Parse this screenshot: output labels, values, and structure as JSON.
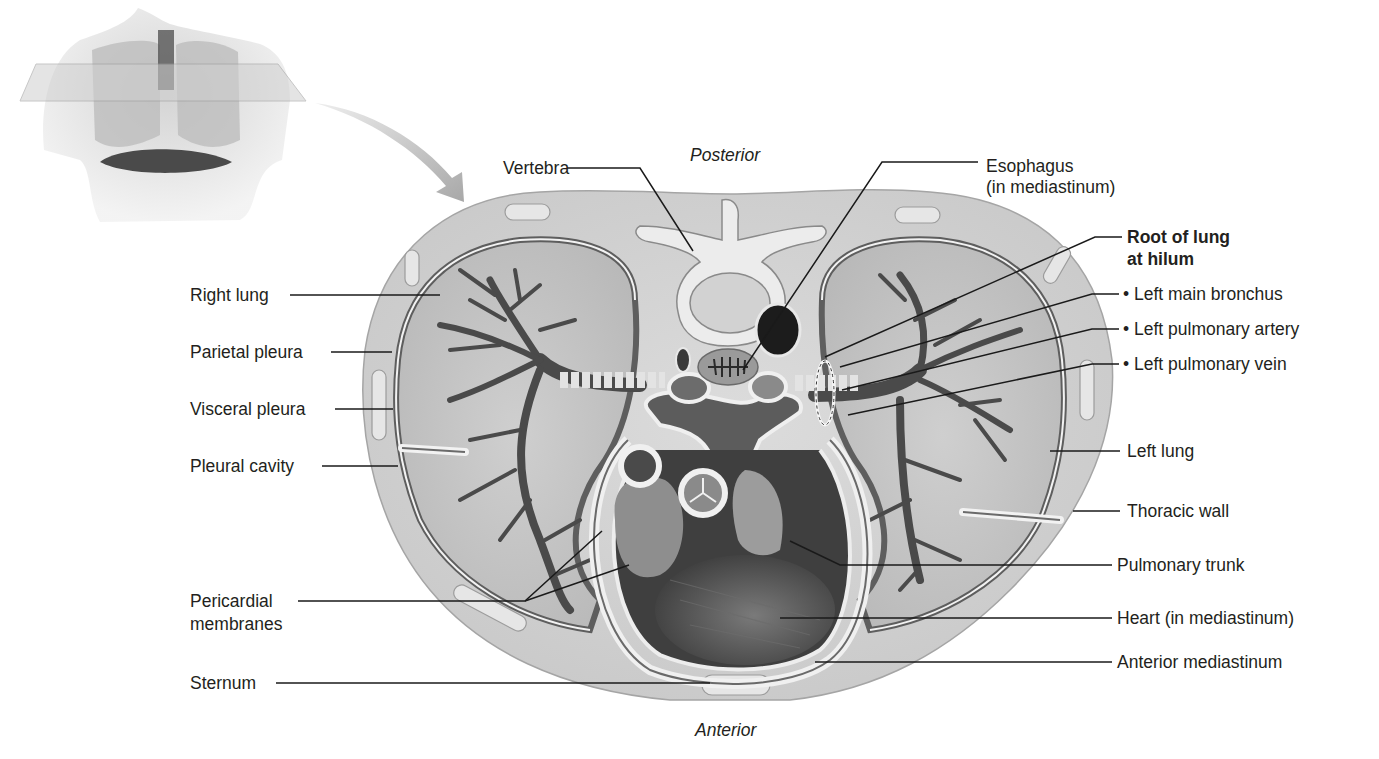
{
  "figure": {
    "orientation": {
      "top": "Posterior",
      "bottom": "Anterior"
    },
    "inset": {
      "description": "Anterior view of torso with transverse cutting plane through thorax",
      "icon": "torso-section-plane-icon",
      "arrow": "curved-arrow-icon"
    }
  },
  "labels": {
    "left": [
      {
        "id": "right-lung",
        "text": "Right lung"
      },
      {
        "id": "parietal-pleura",
        "text": "Parietal pleura"
      },
      {
        "id": "visceral-pleura",
        "text": "Visceral pleura"
      },
      {
        "id": "pleural-cavity",
        "text": "Pleural cavity"
      },
      {
        "id": "pericardial-membranes",
        "line1": "Pericardial",
        "line2": "membranes"
      },
      {
        "id": "sternum",
        "text": "Sternum"
      }
    ],
    "top": [
      {
        "id": "vertebra",
        "text": "Vertebra"
      },
      {
        "id": "esophagus",
        "line1": "Esophagus",
        "line2": "(in mediastinum)"
      }
    ],
    "right": [
      {
        "id": "root-of-lung",
        "line1": "Root of lung",
        "line2": "at hilum",
        "bold": true
      },
      {
        "id": "left-main-bronchus",
        "text": "• Left main bronchus"
      },
      {
        "id": "left-pulmonary-artery",
        "text": "• Left pulmonary artery"
      },
      {
        "id": "left-pulmonary-vein",
        "text": "• Left pulmonary vein"
      },
      {
        "id": "left-lung",
        "text": "Left lung"
      },
      {
        "id": "thoracic-wall",
        "text": "Thoracic wall"
      },
      {
        "id": "pulmonary-trunk",
        "text": "Pulmonary trunk"
      },
      {
        "id": "heart",
        "text": "Heart (in mediastinum)"
      },
      {
        "id": "anterior-mediastinum",
        "text": "Anterior mediastinum"
      }
    ]
  },
  "colors": {
    "background": "#ffffff",
    "text": "#231f20",
    "leader_line": "#1a1a1a",
    "thoracic_wall": "#d6d6d6",
    "lung_tissue": "#c4c4c4",
    "pleura_dark": "#6e6e6e",
    "bronchial_tree": "#4f4f4f",
    "heart": "#5a5a5a",
    "bone": "#e8e8e8"
  }
}
